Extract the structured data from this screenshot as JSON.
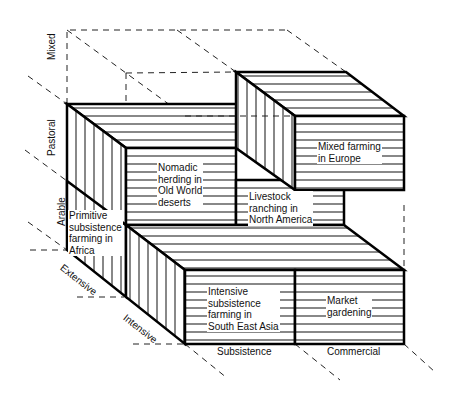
{
  "diagram": {
    "type": "3d-block-classification",
    "axes": {
      "vertical": {
        "labels": [
          "Arable",
          "Pastoral",
          "Mixed"
        ]
      },
      "depth": {
        "labels": [
          "Extensive",
          "Intensive"
        ]
      },
      "horizontal": {
        "labels": [
          "Subsistence",
          "Commercial"
        ]
      }
    },
    "blocks": [
      {
        "id": "africa",
        "text": "Primitive subsistence farming in Africa",
        "lines": [
          "Primitive",
          "subsistence",
          "farming in",
          "Africa"
        ]
      },
      {
        "id": "nomadic",
        "text": "Nomadic herding in Old World deserts",
        "lines": [
          "Nomadic",
          "herding in",
          "Old World",
          "deserts"
        ]
      },
      {
        "id": "livestock",
        "text": "Livestock ranching in North America",
        "lines": [
          "Livestock",
          "ranching in",
          "North America"
        ]
      },
      {
        "id": "europe",
        "text": "Mixed farming in Europe",
        "lines": [
          "Mixed farming",
          "in Europe"
        ]
      },
      {
        "id": "seasia",
        "text": "Intensive subsistence farming in South East Asia",
        "lines": [
          "Intensive",
          "subsistence",
          "farming in",
          "South East Asia"
        ]
      },
      {
        "id": "market",
        "text": "Market gardening",
        "lines": [
          "Market",
          "gardening"
        ]
      }
    ]
  }
}
